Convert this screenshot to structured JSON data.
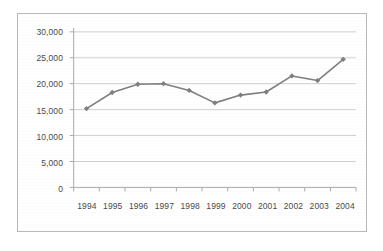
{
  "chart_data": {
    "type": "line",
    "title": "",
    "subtitle": "",
    "xlabel": "",
    "ylabel": "",
    "categories": [
      "1994",
      "1995",
      "1996",
      "1997",
      "1998",
      "1999",
      "2000",
      "2001",
      "2002",
      "2003",
      "2004"
    ],
    "values": [
      15200,
      18300,
      19900,
      20000,
      18700,
      16300,
      17800,
      18400,
      21500,
      20600,
      24700
    ],
    "series": [
      {
        "name": "",
        "values": [
          15200,
          18300,
          19900,
          20000,
          18700,
          16300,
          17800,
          18400,
          21500,
          20600,
          24700
        ]
      }
    ],
    "ylim": [
      0,
      30000
    ],
    "ytick_labels": [
      "0",
      "5,000",
      "10,000",
      "15,000",
      "20,000",
      "25,000",
      "30,000"
    ],
    "ytick_values": [
      0,
      5000,
      10000,
      15000,
      20000,
      25000,
      30000
    ],
    "grid": true,
    "grid_axis": "y",
    "legend": false,
    "legend_position": "none",
    "markers": "diamond",
    "colors": {
      "line": "#7f7f7f",
      "marker": "#7f7f7f",
      "grid": "#d0d0d0",
      "axis": "#a8a8a8",
      "border": "#b9b9b9",
      "text": "#4a4a4a",
      "background": "#ffffff"
    }
  }
}
